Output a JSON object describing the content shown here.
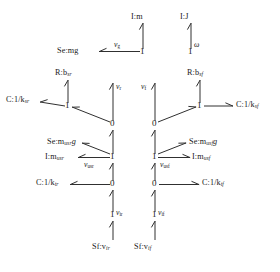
{
  "diagram": {
    "type": "bond-graph",
    "background": "#ffffff",
    "stroke": "#303030"
  },
  "elements": {
    "inertia_m": "I:m",
    "inertia_J": "I:J",
    "source_effort_mg": "Se:mg",
    "resistance_rear": "R:b",
    "resistance_rear_sub": "sr",
    "resistance_front": "R:b",
    "resistance_front_sub": "sf",
    "compliance_susp_rear": "C:1/k",
    "compliance_susp_rear_sub": "sr",
    "compliance_susp_front": "C:1/k",
    "compliance_susp_front_sub": "sf",
    "source_effort_usr": "Se:m",
    "source_effort_usr_sub": "usr",
    "source_effort_usr_tail": "g",
    "source_effort_usf": "Se:m",
    "source_effort_usf_sub": "usf",
    "source_effort_usf_tail": "g",
    "inertia_usr": "I:m",
    "inertia_usr_sub": "usr",
    "inertia_usf": "I:m",
    "inertia_usf_sub": "usf",
    "compliance_tire_rear": "C:1/k",
    "compliance_tire_rear_sub": "tr",
    "compliance_tire_front": "C:1/k",
    "compliance_tire_front_sub": "tf",
    "source_flow_rear": "Sf:v",
    "source_flow_rear_sub": "ir",
    "source_flow_front": "Sf:v",
    "source_flow_front_sub": "if"
  },
  "junctions": {
    "one_body_vertical": "1",
    "one_body_rotation": "1",
    "one_susp_rear": "1",
    "one_susp_front": "1",
    "zero_rear_upper": "0",
    "zero_front_upper": "0",
    "one_unsprung_rear": "1",
    "one_unsprung_front": "1",
    "zero_rear_lower": "0",
    "zero_front_lower": "0",
    "one_input_rear": "1",
    "one_input_front": "1"
  },
  "bond_labels": {
    "v_g": "v",
    "v_g_sub": "g",
    "omega": "ω",
    "v_r": "v",
    "v_r_sub": "r",
    "v_f": "v",
    "v_f_sub": "f",
    "v_usr": "v",
    "v_usr_sub": "usr",
    "v_usf": "v",
    "v_usf_sub": "usf",
    "v_ir": "v",
    "v_ir_sub": "ir",
    "v_if": "v",
    "v_if_sub": "if"
  }
}
